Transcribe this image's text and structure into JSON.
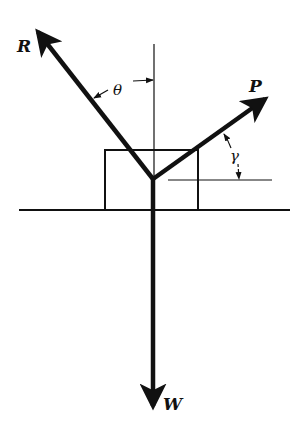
{
  "diagram": {
    "forces": [
      {
        "id": "R",
        "label": "R"
      },
      {
        "id": "P",
        "label": "P"
      },
      {
        "id": "W",
        "label": "W"
      }
    ],
    "angles": [
      {
        "id": "theta",
        "label": "θ",
        "between": "R and vertical"
      },
      {
        "id": "gamma",
        "label": "γ",
        "between": "P and horizontal"
      }
    ],
    "colors": {
      "ink": "#111111",
      "background": "#ffffff"
    }
  }
}
